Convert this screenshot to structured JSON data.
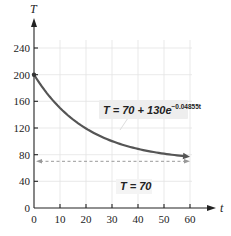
{
  "chart_data": {
    "type": "line",
    "title": "",
    "xlabel": "t",
    "ylabel": "T",
    "xlim": [
      0,
      60
    ],
    "ylim": [
      0,
      240
    ],
    "grid": true,
    "x_ticks": [
      0,
      10,
      20,
      30,
      40,
      50,
      60
    ],
    "y_ticks": [
      0,
      40,
      80,
      120,
      160,
      200,
      240
    ],
    "series": [
      {
        "name": "T = 70 + 130e^(-0.04855t)",
        "formula": {
          "a": 70,
          "b": 130,
          "k": -0.04855
        },
        "x": [
          0,
          5,
          10,
          15,
          20,
          25,
          30,
          35,
          40,
          45,
          50,
          55,
          60
        ],
        "values": [
          200,
          172.6,
          150.1,
          131.2,
          115.2,
          102.2,
          91.3,
          82.4,
          75.0,
          69.0,
          83.0,
          79.0,
          77.1
        ],
        "color": "#555555",
        "arrow_end": true
      },
      {
        "name": "T = 70",
        "x": [
          0,
          60
        ],
        "values": [
          70,
          70
        ],
        "style": "dashed",
        "color": "#999999",
        "arrows": "both"
      }
    ],
    "annotations": [
      {
        "text_main": "T = 70 + 130e",
        "text_exp": "−0.04855t",
        "x": 40,
        "y": 135,
        "boxed": true
      },
      {
        "text_main": "T = 70",
        "x": 36,
        "y": 40
      }
    ],
    "points": [
      {
        "x": 0,
        "y": 200
      }
    ]
  },
  "labels": {
    "y_axis": "T",
    "x_axis": "t",
    "y_ticks": [
      "0",
      "40",
      "80",
      "120",
      "160",
      "200",
      "240"
    ],
    "x_ticks": [
      "0",
      "10",
      "20",
      "30",
      "40",
      "50",
      "60"
    ],
    "curve_label_main": "T = 70 + 130e",
    "curve_label_exp": "−0.04855t",
    "asymptote_label": "T = 70"
  }
}
